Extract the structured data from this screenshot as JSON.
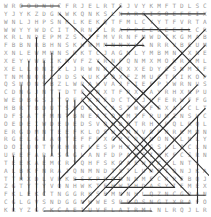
{
  "puzzle": {
    "type": "word-search",
    "rows": 27,
    "cols": 27,
    "grid": [
      "WROODNUCFRJELRTSJVYKMFTDLSC",
      "YJYKZDGNWKQNKSLNARGISOEFEIX",
      "WNLJHPSNKLKEKQTFMLCYYTFVRTA",
      "WWYYWDCITYRNTLRAPPEEEEEILCR",
      "KRLNDEPMZSTTFMVRNFMWDTKGMAB",
      "FBBNRBHNSKHWMMNNXLLNRRVBEUM",
      "XNLEWMMNSRKTCJAGNLYMBMNIXNE",
      "XEYVWEIKMVFZYRNFQNMXMORRGMLS",
      "XELLONZELJRWNRXRXXEDYCSNMJF",
      "TNMNQRLDDSYUKEOXFZMUCTRIKOP",
      "QSMONSBZLWRAWVAJFIEFPJWRNUS",
      "CDNGJNTTDTFXNXTFRXDAYRHXNPU",
      "WEDBGSJTOFFKNFDCTEJVFERWFFG",
      "HBRTBDUTSWOGLYASTWTFGXALCLT",
      "DFSATFMNTBNEATONMTFPUMZNSUC",
      "OEDEIWDEDEDSVQNDOTRHVPQLRQL",
      "ERGDMNTEEFKLOSWJMWVOPNRKMMN",
      "RGELGLAQTEFFPXGPTRNNONPLNLY",
      "DOIUOTVRHRFLESPHXRLGSLLQCLN",
      "UEEFARASGGLANFDPAKSIXKFCSRN",
      "TEEKAEMCRTQHFSKOAEWKKSLNTS",
      "ALBKFNRAJQNMNDTXTLUMOTQNJKA",
      "TTHXDLVRKBSKPROMNNMECRPEBQJ",
      "ZGTYTYVQNHWKTEHWIHDASYIEMEXS",
      "FKLEKCTNGGRKSBMNNHLQZNCGRANE",
      "CGLGVSNDGGNWWESPPOSNGIXRAFOB",
      "KRYZGCKCAEIUVFLAIRMLNLRQJLR"
    ]
  },
  "found_lines_count": 40,
  "colors": {
    "background": "#ffffff",
    "letter": "#9a9a9a",
    "strike_line": "#333333"
  }
}
